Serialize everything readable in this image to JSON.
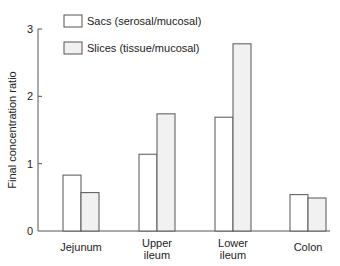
{
  "chart_data": {
    "type": "bar",
    "title": "",
    "xlabel": "",
    "ylabel": "Final concentration ratio",
    "ylim": [
      0,
      3
    ],
    "yticks": [
      "0",
      "1",
      "2",
      "3"
    ],
    "grid": false,
    "legend_position": "top-left",
    "categories": [
      "Jejunum",
      "Upper ileum",
      "Lower ileum",
      "Colon"
    ],
    "category_labels": [
      [
        "Jejunum"
      ],
      [
        "Upper",
        "ileum"
      ],
      [
        "Lower",
        "ileum"
      ],
      [
        "Colon"
      ]
    ],
    "series": [
      {
        "name": "Sacs (serosal/mucosal)",
        "values": [
          0.83,
          1.14,
          1.69,
          0.54
        ],
        "fill": "#ffffff"
      },
      {
        "name": "Slices (tissue/mucosal)",
        "values": [
          0.57,
          1.74,
          2.78,
          0.49
        ],
        "fill": "#f1f1f1"
      }
    ],
    "colors": {
      "stroke": "#555555",
      "text": "#222222"
    }
  }
}
